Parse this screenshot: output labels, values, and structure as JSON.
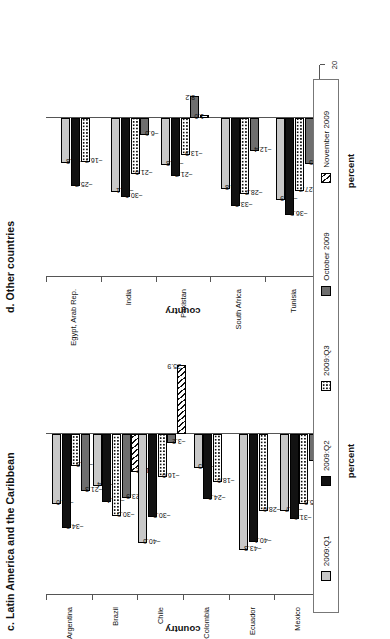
{
  "figure": {
    "legend": [
      {
        "label": "2009:Q1",
        "key": "q1",
        "swatch": "light-gray-solid"
      },
      {
        "label": "2009:Q2",
        "key": "q2",
        "swatch": "black-solid"
      },
      {
        "label": "2009:Q3",
        "key": "q3",
        "swatch": "white-dotted"
      },
      {
        "label": "October 2009",
        "key": "oct",
        "swatch": "dark-gray-solid"
      },
      {
        "label": "November 2009",
        "key": "nov",
        "swatch": "white-diagonal-hatch"
      }
    ]
  },
  "chart_data": [
    {
      "type": "bar",
      "panel": "c",
      "title": "c. Latin America and the Caribbean",
      "orientation": "horizontal",
      "xlabel": "country",
      "ylabel": "percent",
      "ylim": [
        -60,
        40
      ],
      "yticks": [
        40,
        20,
        0,
        -20,
        -40,
        -60
      ],
      "grid": false,
      "legend_position": "bottom",
      "categories": [
        "Argentina",
        "Brazil",
        "Chile",
        "Colombia",
        "Ecuador",
        "Mexico"
      ],
      "series": [
        {
          "name": "2009:Q1",
          "key": "q1",
          "values": [
            -26.0,
            -19.4,
            -40.6,
            -12.5,
            -43.3,
            -28.7
          ]
        },
        {
          "name": "2009:Q2",
          "key": "q2",
          "values": [
            -34.9,
            -25.4,
            -30.9,
            -24.0,
            -40.1,
            -31.6
          ]
        },
        {
          "name": "2009:Q3",
          "key": "q3",
          "values": [
            -11.9,
            -30.5,
            -16.0,
            -18.0,
            -28.6,
            -25.9
          ]
        },
        {
          "name": "October 2009",
          "key": "oct",
          "values": [
            -21.3,
            -23.9,
            -3.2,
            null,
            null,
            -10.1
          ]
        },
        {
          "name": "November 2009",
          "key": "nov",
          "values": [
            null,
            -14.2,
            25.9,
            null,
            null,
            null
          ]
        }
      ]
    },
    {
      "type": "bar",
      "panel": "d",
      "title": "d. Other countries",
      "orientation": "horizontal",
      "xlabel": "country",
      "ylabel": "percent",
      "ylim": [
        -60,
        20
      ],
      "yticks": [
        20,
        0,
        -20,
        -40,
        -60
      ],
      "grid": false,
      "legend_position": "bottom",
      "categories": [
        "Egypt, Arab Rep.",
        "India",
        "Pakistan",
        "South Africa",
        "Tunisia"
      ],
      "series": [
        {
          "name": "2009:Q1",
          "key": "q1",
          "values": [
            -16.8,
            -28.1,
            -17.8,
            -26.8,
            -30.9
          ]
        },
        {
          "name": "2009:Q2",
          "key": "q2",
          "values": [
            -25.7,
            -30.0,
            -21.7,
            -33.2,
            -36.5
          ]
        },
        {
          "name": "2009:Q3",
          "key": "q3",
          "values": [
            -16.7,
            -21.0,
            -13.9,
            -28.7,
            -27.7
          ]
        },
        {
          "name": "October 2009",
          "key": "oct",
          "values": [
            null,
            -6.6,
            8.2,
            -12.4,
            -17.5
          ]
        },
        {
          "name": "November 2009",
          "key": "nov",
          "values": [
            null,
            null,
            1.0,
            null,
            null
          ]
        }
      ]
    }
  ]
}
